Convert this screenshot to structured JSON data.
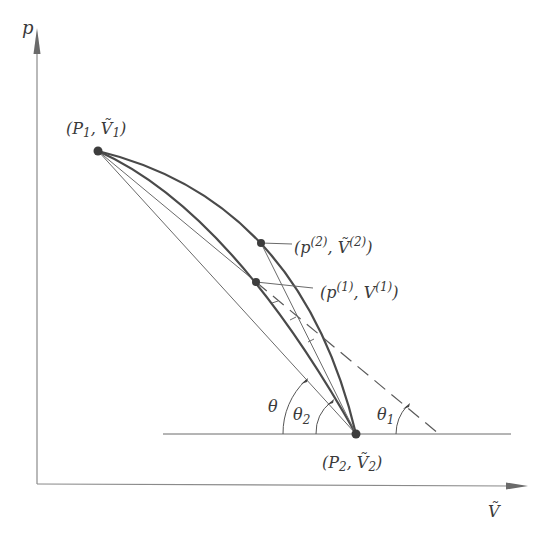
{
  "diagram": {
    "axes": {
      "y_label": "p",
      "x_label": "Ṽ"
    },
    "points": {
      "p1": {
        "label_main": "(P",
        "label_sub": "1",
        "label_sep": ", ",
        "label_v": "Ṽ",
        "label_vsub": "1",
        "label_close": ")"
      },
      "p2": {
        "label_main": "(P",
        "label_sub": "2",
        "label_sep": ", ",
        "label_v": "Ṽ",
        "label_vsub": "2",
        "label_close": ")"
      },
      "iter2": {
        "label_open": "(p",
        "label_sup": "(2)",
        "label_sep": ", ",
        "label_v": "Ṽ",
        "label_vsup": "(2)",
        "label_close": ")"
      },
      "iter1": {
        "label_open": "(p",
        "label_sup": "(1)",
        "label_sep": ", ",
        "label_v": "V",
        "label_vsup": "(1)",
        "label_close": ")"
      }
    },
    "angles": {
      "theta": "θ",
      "theta1_main": "θ",
      "theta1_sub": "1",
      "theta2_main": "θ",
      "theta2_sub": "2"
    }
  }
}
